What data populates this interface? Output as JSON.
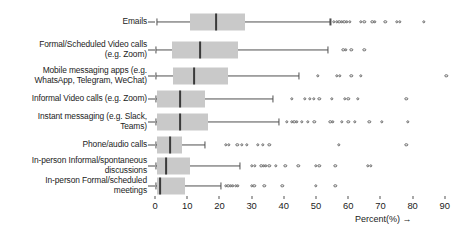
{
  "chart_data": {
    "type": "box",
    "title": "",
    "xlabel": "Percent(%) →",
    "ylabel": "",
    "xlim": [
      -2,
      95
    ],
    "grid": false,
    "legend": "none",
    "orientation": "horizontal",
    "xticks": [
      0,
      10,
      20,
      30,
      40,
      50,
      60,
      70,
      80,
      90
    ],
    "xticklabels": [
      "0",
      "10",
      "20",
      "30",
      "40",
      "50",
      "60",
      "70",
      "80",
      "90"
    ],
    "categories": [
      "Emails",
      "Formal/Scheduled Video calls\n(e.g. Zoom)",
      "Mobile messaging apps (e.g.\nWhatsApp, Telegram, WeChat)",
      "Informal Video calls (e.g. Zoom)",
      "Instant messaging (e.g. Slack,\nTeams)",
      "Phone/audio calls",
      "In-person Informal/spontaneous\ndiscussions",
      "In-person Formal/scheduled\nmeetings"
    ],
    "boxes": [
      {
        "category": "Emails",
        "whisker_low": 0.5,
        "q1": 11.0,
        "median": 19.0,
        "q3": 28.0,
        "whisker_high": 54.5,
        "outliers": [
          55.5,
          56.5,
          57.2,
          58.0,
          58.8,
          59.6,
          60.5,
          64.0,
          65.0,
          67.5,
          68.3,
          71.5,
          75.0,
          76.0,
          83.5
        ]
      },
      {
        "category": "Formal/Scheduled Video calls (e.g. Zoom)",
        "whisker_low": 0.4,
        "q1": 5.3,
        "median": 14.0,
        "q3": 25.8,
        "whisker_high": 53.8,
        "outliers": [
          58.5,
          59.3,
          61.0,
          65.0
        ]
      },
      {
        "category": "Mobile messaging apps (e.g. WhatsApp, Telegram, WeChat)",
        "whisker_low": 0.4,
        "q1": 5.6,
        "median": 12.2,
        "q3": 22.8,
        "whisker_high": 44.7,
        "outliers": [
          50.5,
          56.5,
          57.3,
          61.0,
          64.0,
          90.5
        ]
      },
      {
        "category": "Informal Video calls (e.g. Zoom)",
        "whisker_low": 0.3,
        "q1": 0.5,
        "median": 7.8,
        "q3": 15.6,
        "whisker_high": 36.5,
        "outliers": [
          42.5,
          46.5,
          48.0,
          49.3,
          51.0,
          55.0,
          59.0,
          60.0,
          63.0,
          78.0
        ]
      },
      {
        "category": "Instant messaging (e.g. Slack, Teams)",
        "whisker_low": 0.3,
        "q1": 0.5,
        "median": 7.8,
        "q3": 16.6,
        "whisker_high": 38.5,
        "outliers": [
          41.0,
          42.5,
          43.3,
          44.0,
          45.5,
          47.5,
          49.5,
          54.5,
          55.3,
          58.0,
          60.0,
          62.0,
          66.5,
          70.5,
          78.5
        ]
      },
      {
        "category": "Phone/audio calls",
        "whisker_low": 0.3,
        "q1": 0.5,
        "median": 4.7,
        "q3": 8.5,
        "whisker_high": 15.5,
        "outliers": [
          22.0,
          23.0,
          25.5,
          27.0,
          28.5,
          32.0,
          33.5,
          35.5,
          57.0,
          78.0
        ]
      },
      {
        "category": "In-person Informal/spontaneous discussions",
        "whisker_low": 0.3,
        "q1": 0.5,
        "median": 3.5,
        "q3": 11.0,
        "whisker_high": 26.5,
        "outliers": [
          30.0,
          31.0,
          33.0,
          33.8,
          34.5,
          35.5,
          37.5,
          40.5,
          44.5,
          50.0,
          51.0,
          56.0,
          66.0,
          67.0
        ]
      },
      {
        "category": "In-person Formal/scheduled meetings",
        "whisker_low": 0.3,
        "q1": 0.5,
        "median": 1.6,
        "q3": 9.4,
        "whisker_high": 20.5,
        "outliers": [
          22.0,
          22.8,
          23.5,
          24.2,
          25.0,
          25.8,
          30.0,
          30.8,
          34.0,
          39.5,
          50.0,
          56.0
        ]
      }
    ]
  },
  "style": {
    "box_fill": "#c9c9c9",
    "median_color": "#3a3a3a",
    "whisker_color": "#4f4f4f",
    "outlier_color": "#6a6a6a",
    "text_color": "#1b1b1b",
    "background": "#ffffff"
  },
  "layout": {
    "row_y": [
      22,
      50,
      76,
      99,
      122,
      145,
      166,
      186
    ],
    "x0_px": 155,
    "px_per_unit": 3.22,
    "box_height": 17,
    "axis_top_px": 196
  }
}
